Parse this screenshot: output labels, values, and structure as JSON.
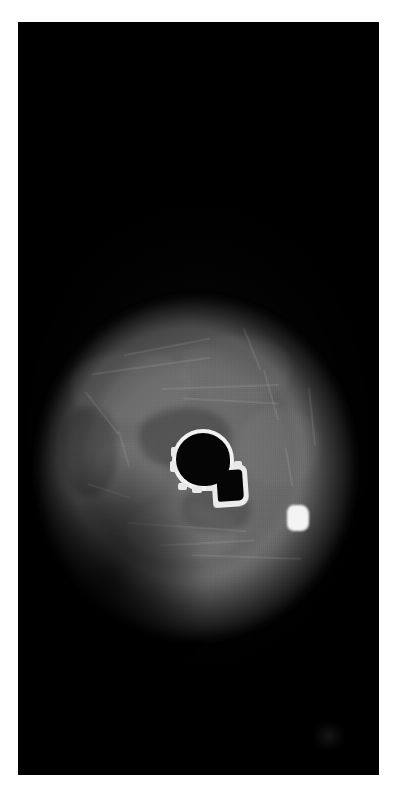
{
  "image": {
    "modality_label": "medical-cross-section-scan",
    "orientation": "axial",
    "background_color": "#ffffff",
    "canvas_color": "#000000",
    "canvas": {
      "x": 18,
      "y": 22,
      "width": 361,
      "height": 753
    }
  },
  "regions": {
    "soft_tissue": {
      "name": "soft-tissue-oval",
      "center_x": 178,
      "center_y": 468,
      "width": 330,
      "height": 355,
      "mean_gray": "#6b6b6b"
    },
    "bone": {
      "name": "bone-cross-section",
      "cortical_color": "#f2f2f2",
      "marrow_color": "#050505",
      "center_x": 196,
      "center_y": 462,
      "width": 90,
      "height": 95
    },
    "calcification": {
      "name": "bright-focus",
      "color": "#f4f4f4",
      "center_x": 298,
      "center_y": 518,
      "width": 22,
      "height": 26
    },
    "artifact": {
      "name": "low-contrast-artifact",
      "center_x": 311,
      "center_y": 714
    }
  },
  "fascial_planes": [
    {
      "left": 60,
      "top": 75,
      "width": 120,
      "height": 2,
      "rotate": -8
    },
    {
      "left": 92,
      "top": 56,
      "width": 88,
      "height": 2,
      "rotate": -11
    },
    {
      "left": 130,
      "top": 96,
      "width": 118,
      "height": 2,
      "rotate": -2
    },
    {
      "left": 152,
      "top": 110,
      "width": 96,
      "height": 2,
      "rotate": 3
    },
    {
      "left": 44,
      "top": 122,
      "width": 54,
      "height": 2,
      "rotate": 52
    },
    {
      "left": 198,
      "top": 58,
      "width": 46,
      "height": 2,
      "rotate": 68
    },
    {
      "left": 214,
      "top": 104,
      "width": 52,
      "height": 2,
      "rotate": 74
    },
    {
      "left": 96,
      "top": 236,
      "width": 120,
      "height": 2,
      "rotate": 4
    },
    {
      "left": 128,
      "top": 252,
      "width": 96,
      "height": 2,
      "rotate": -3
    },
    {
      "left": 160,
      "top": 266,
      "width": 110,
      "height": 2,
      "rotate": 2
    },
    {
      "left": 56,
      "top": 200,
      "width": 44,
      "height": 2,
      "rotate": 18
    },
    {
      "left": 238,
      "top": 176,
      "width": 40,
      "height": 2,
      "rotate": 80
    },
    {
      "left": 252,
      "top": 126,
      "width": 58,
      "height": 2,
      "rotate": 84
    },
    {
      "left": 74,
      "top": 158,
      "width": 38,
      "height": 2,
      "rotate": 74
    }
  ],
  "muscle_blobs": [
    {
      "left": 40,
      "top": 62,
      "width": 120,
      "height": 70,
      "color": "rgba(255,255,255,0.045)"
    },
    {
      "left": 150,
      "top": 46,
      "width": 110,
      "height": 66,
      "color": "rgba(255,255,255,0.040)"
    },
    {
      "left": 208,
      "top": 118,
      "width": 80,
      "height": 78,
      "color": "rgba(255,255,255,0.038)"
    },
    {
      "left": 62,
      "top": 150,
      "width": 70,
      "height": 64,
      "color": "rgba(255,255,255,0.030)"
    },
    {
      "left": 96,
      "top": 214,
      "width": 110,
      "height": 56,
      "color": "rgba(255,255,255,0.042)"
    },
    {
      "left": 108,
      "top": 118,
      "width": 92,
      "height": 60,
      "color": "rgba(0,0,0,0.22)"
    },
    {
      "left": 150,
      "top": 196,
      "width": 70,
      "height": 46,
      "color": "rgba(0,0,0,0.18)"
    },
    {
      "left": 30,
      "top": 116,
      "width": 56,
      "height": 90,
      "color": "rgba(0,0,0,0.20)"
    }
  ],
  "cortical_notches": [
    {
      "left": 10,
      "top": 56,
      "width": 9,
      "height": 7
    },
    {
      "left": 24,
      "top": 59,
      "width": 10,
      "height": 7
    },
    {
      "left": 38,
      "top": 57,
      "width": 9,
      "height": 7
    },
    {
      "left": 2,
      "top": 34,
      "width": 7,
      "height": 11
    },
    {
      "left": 3,
      "top": 20,
      "width": 7,
      "height": 10
    },
    {
      "left": 54,
      "top": 70,
      "width": 12,
      "height": 8
    },
    {
      "left": 66,
      "top": 34,
      "width": 8,
      "height": 14
    }
  ]
}
